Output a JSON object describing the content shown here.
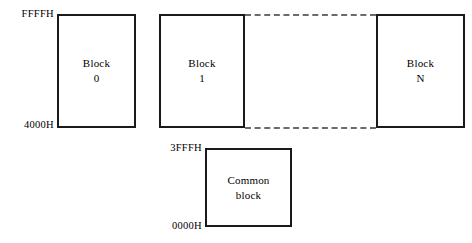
{
  "diagram": {
    "blocks": [
      {
        "name": "block-0",
        "title": "Block",
        "index": "0"
      },
      {
        "name": "block-1",
        "title": "Block",
        "index": "1"
      },
      {
        "name": "block-n",
        "title": "Block",
        "index": "N"
      }
    ],
    "common_block": {
      "line1": "Common",
      "line2": "block"
    },
    "address_labels": {
      "upper_block_top": "FFFFH",
      "upper_block_bottom": "4000H",
      "common_block_top": "3FFFH",
      "common_block_bottom": "0000H"
    },
    "connectors": {
      "top_dashed": "dashed-continuation-line",
      "bottom_dashed": "dashed-continuation-line"
    },
    "colors": {
      "background": "#ffffff",
      "stroke": "#1a1a1a",
      "dashed_stroke": "#6b6b6b",
      "text": "#000000"
    }
  }
}
